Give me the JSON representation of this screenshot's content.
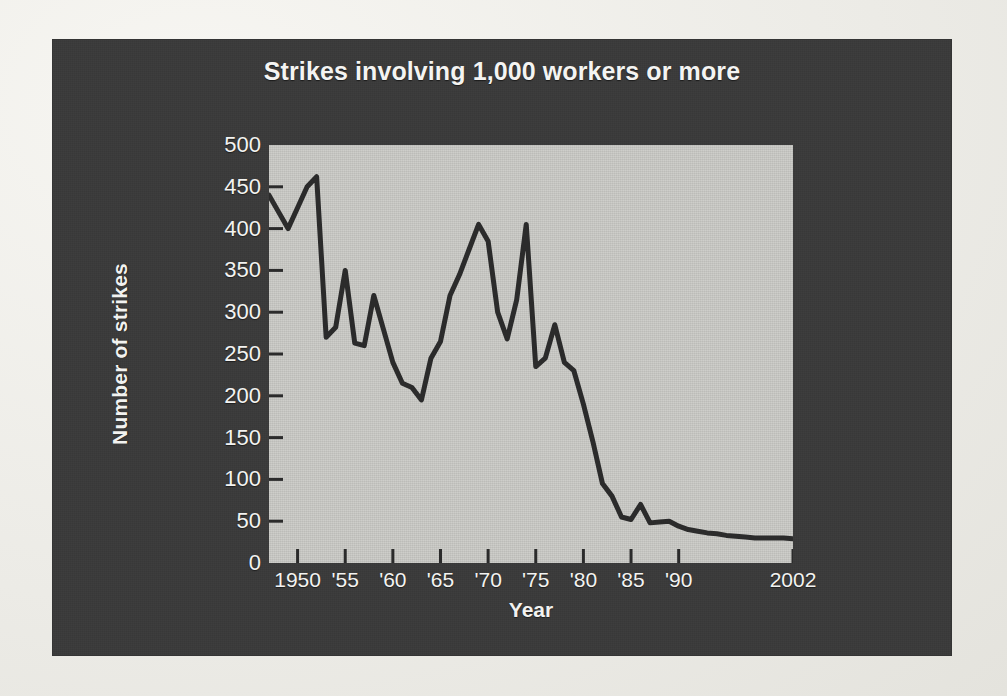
{
  "chart_data": {
    "type": "line",
    "title": "Strikes involving 1,000 workers or more",
    "xlabel": "Year",
    "ylabel": "Number of strikes",
    "grid": false,
    "legend": "none",
    "xlim": [
      1947,
      2002
    ],
    "ylim": [
      0,
      500
    ],
    "y_ticks": [
      500,
      450,
      400,
      350,
      300,
      250,
      200,
      150,
      100,
      50,
      0
    ],
    "x_tick_labels": [
      "1950",
      "'55",
      "'60",
      "'65",
      "'70",
      "'75",
      "'80",
      "'85",
      "'90",
      "2002"
    ],
    "x_tick_values": [
      1950,
      1955,
      1960,
      1965,
      1970,
      1975,
      1980,
      1985,
      1990,
      2002
    ],
    "series": [
      {
        "name": "Number of strikes",
        "color": "#2b2b2b",
        "x": [
          1947,
          1948,
          1949,
          1950,
          1951,
          1952,
          1953,
          1954,
          1955,
          1956,
          1957,
          1958,
          1959,
          1960,
          1961,
          1962,
          1963,
          1964,
          1965,
          1966,
          1967,
          1968,
          1969,
          1970,
          1971,
          1972,
          1973,
          1974,
          1975,
          1976,
          1977,
          1978,
          1979,
          1980,
          1981,
          1982,
          1983,
          1984,
          1985,
          1986,
          1987,
          1988,
          1989,
          1990,
          1991,
          1992,
          1993,
          1994,
          1995,
          1996,
          1997,
          1998,
          1999,
          2000,
          2001,
          2002
        ],
        "values": [
          440,
          420,
          400,
          425,
          450,
          462,
          270,
          282,
          350,
          263,
          260,
          320,
          280,
          240,
          215,
          210,
          195,
          245,
          265,
          320,
          345,
          375,
          405,
          385,
          300,
          268,
          315,
          405,
          235,
          245,
          285,
          240,
          230,
          190,
          145,
          95,
          80,
          55,
          52,
          70,
          48,
          49,
          50,
          44,
          40,
          38,
          36,
          35,
          33,
          32,
          31,
          30,
          30,
          30,
          30,
          29
        ]
      }
    ]
  },
  "chart": {
    "title": "Strikes involving 1,000 workers or more",
    "y_axis_title": "Number of strikes",
    "x_axis_title": "Year"
  }
}
